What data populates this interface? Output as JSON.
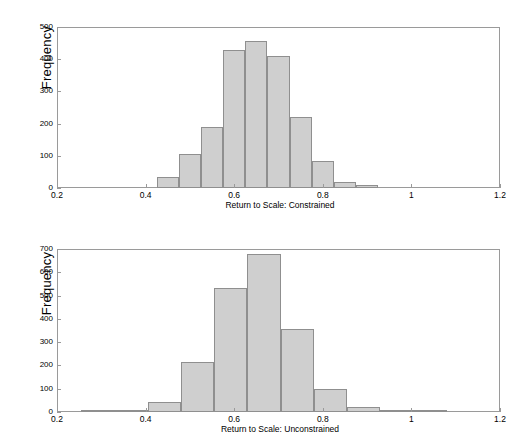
{
  "figure": {
    "background": "#ffffff",
    "bar_fill": "#cfcfcf",
    "bar_edge": "#8f8f8f",
    "axis_color": "#9a9a9a"
  },
  "chart_data": [
    {
      "type": "bar",
      "title": "",
      "xlabel": "Return to Scale: Constrained",
      "ylabel": "Frequency",
      "xlim": [
        0.2,
        1.2
      ],
      "ylim": [
        0,
        500
      ],
      "grid": false,
      "legend": null,
      "xticks": [
        "0.2",
        "0.4",
        "0.6",
        "0.8",
        "1",
        "1.2"
      ],
      "xtick_values": [
        0.2,
        0.4,
        0.6,
        0.8,
        1.0,
        1.2
      ],
      "yticks": [
        "0",
        "100",
        "200",
        "300",
        "400",
        "500"
      ],
      "ytick_values": [
        0,
        100,
        200,
        300,
        400,
        500
      ],
      "bin_edges": [
        0.425,
        0.475,
        0.525,
        0.575,
        0.625,
        0.675,
        0.725,
        0.775,
        0.825,
        0.875,
        0.925,
        0.975
      ],
      "categories": [
        "0.425-0.475",
        "0.475-0.525",
        "0.525-0.575",
        "0.575-0.625",
        "0.625-0.675",
        "0.675-0.725",
        "0.725-0.775",
        "0.775-0.825",
        "0.825-0.875",
        "0.875-0.925",
        "0.925-0.975"
      ],
      "values": [
        35,
        105,
        190,
        430,
        458,
        410,
        220,
        85,
        18,
        10,
        0
      ]
    },
    {
      "type": "bar",
      "title": "",
      "xlabel": "Return to Scale: Unconstrained",
      "ylabel": "Frequency",
      "xlim": [
        0.2,
        1.2
      ],
      "ylim": [
        0,
        700
      ],
      "grid": false,
      "legend": null,
      "xticks": [
        "0.2",
        "0.4",
        "0.6",
        "0.8",
        "1",
        "1.2"
      ],
      "xtick_values": [
        0.2,
        0.4,
        0.6,
        0.8,
        1.0,
        1.2
      ],
      "yticks": [
        "0",
        "100",
        "200",
        "300",
        "400",
        "500",
        "600",
        "700"
      ],
      "ytick_values": [
        0,
        100,
        200,
        300,
        400,
        500,
        600,
        700
      ],
      "bin_edges": [
        0.255,
        0.33,
        0.405,
        0.48,
        0.555,
        0.63,
        0.705,
        0.78,
        0.855,
        0.93,
        1.005,
        1.08
      ],
      "categories": [
        "0.255-0.33",
        "0.33-0.405",
        "0.405-0.48",
        "0.48-0.555",
        "0.555-0.63",
        "0.63-0.705",
        "0.705-0.78",
        "0.78-0.855",
        "0.855-0.93",
        "0.93-1.005",
        "1.005-1.08"
      ],
      "values": [
        2,
        5,
        45,
        215,
        532,
        680,
        357,
        100,
        22,
        3,
        1
      ]
    }
  ]
}
